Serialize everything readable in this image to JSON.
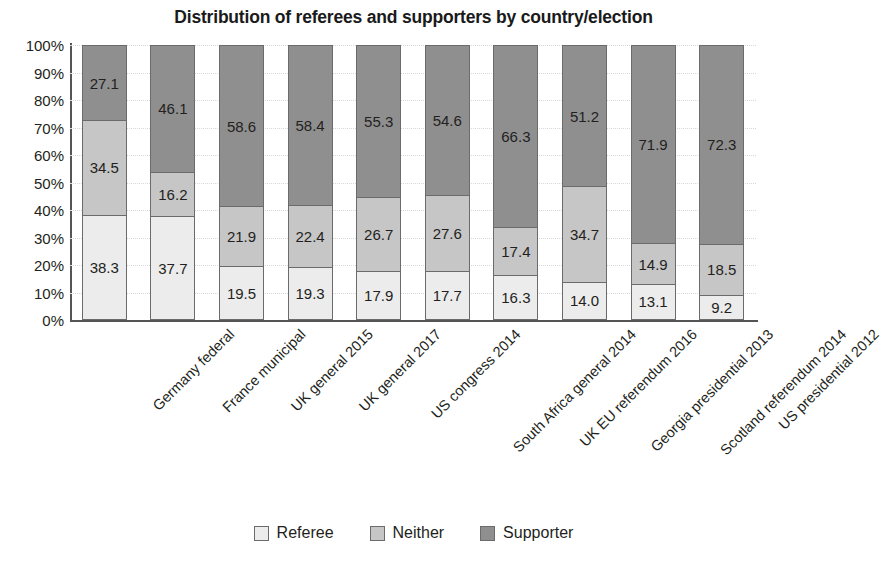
{
  "chart_data": {
    "type": "bar",
    "subtype": "stacked-100-percent",
    "title": "Distribution of referees and supporters by country/election",
    "xlabel": "",
    "ylabel": "",
    "ylim": [
      0,
      100
    ],
    "ytick_labels": [
      "0%",
      "10%",
      "20%",
      "30%",
      "40%",
      "50%",
      "60%",
      "70%",
      "80%",
      "90%",
      "100%"
    ],
    "ytick_values": [
      0,
      10,
      20,
      30,
      40,
      50,
      60,
      70,
      80,
      90,
      100
    ],
    "grid": true,
    "legend_position": "bottom",
    "categories": [
      "Germany federal",
      "France municipal",
      "UK general 2015",
      "UK general 2017",
      "US congress 2014",
      "South Africa general 2014",
      "UK EU referendum 2016",
      "Georgia presidential 2013",
      "Scotland referendum 2014",
      "US presidential 2012"
    ],
    "series": [
      {
        "name": "Referee",
        "color": "#ececec",
        "values": [
          38.3,
          37.7,
          19.5,
          19.3,
          17.9,
          17.7,
          16.3,
          14.0,
          13.1,
          9.2
        ],
        "labels": [
          "38.3",
          "37.7",
          "19.5",
          "19.3",
          "17.9",
          "17.7",
          "16.3",
          "14.0",
          "13.1",
          "9.2"
        ]
      },
      {
        "name": "Neither",
        "color": "#c6c6c6",
        "values": [
          34.5,
          16.2,
          21.9,
          22.4,
          26.7,
          27.6,
          17.4,
          34.7,
          14.9,
          18.5
        ],
        "labels": [
          "34.5",
          "16.2",
          "21.9",
          "22.4",
          "26.7",
          "27.6",
          "17.4",
          "34.7",
          "14.9",
          "18.5"
        ]
      },
      {
        "name": "Supporter",
        "color": "#8f8f8f",
        "values": [
          27.1,
          46.1,
          58.6,
          58.4,
          55.3,
          54.6,
          66.3,
          51.2,
          71.9,
          72.3
        ],
        "labels": [
          "27.1",
          "46.1",
          "58.6",
          "58.4",
          "55.3",
          "54.6",
          "66.3",
          "51.2",
          "71.9",
          "72.3"
        ]
      }
    ]
  }
}
